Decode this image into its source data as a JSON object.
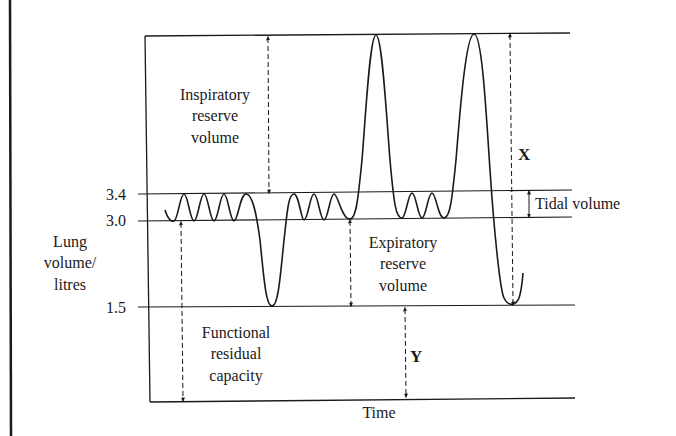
{
  "diagram": {
    "type": "spirogram",
    "y_axis": {
      "label_lines": [
        "Lung",
        "volume/",
        "litres"
      ],
      "ticks": [
        {
          "value": "3.4",
          "y": 194
        },
        {
          "value": "3.0",
          "y": 221
        },
        {
          "value": "1.5",
          "y": 307
        }
      ]
    },
    "x_axis": {
      "label": "Time"
    },
    "annotations": {
      "inspiratory_reserve": [
        "Inspiratory",
        "reserve",
        "volume"
      ],
      "expiratory_reserve": [
        "Expiratory",
        "reserve",
        "volume"
      ],
      "functional_residual": [
        "Functional",
        "residual",
        "capacity"
      ],
      "tidal_volume": "Tidal volume",
      "x_label": "X",
      "y_label": "Y"
    },
    "colors": {
      "line": "#1a1a1a",
      "background": "#ffffff"
    }
  }
}
